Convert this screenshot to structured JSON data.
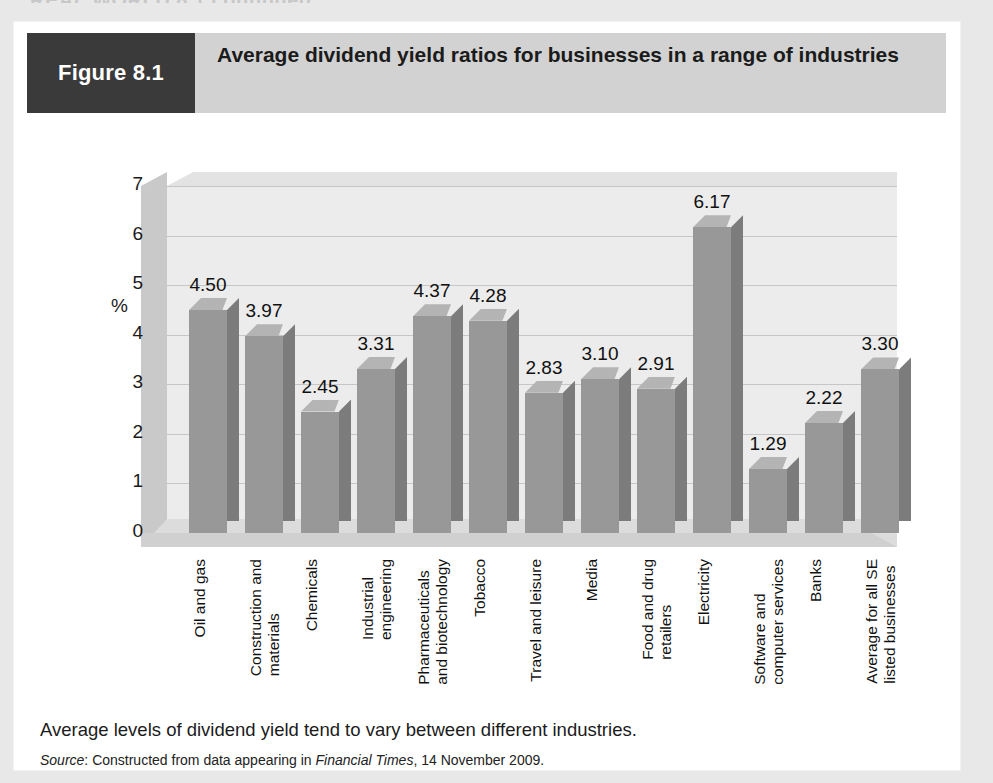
{
  "page": {
    "running_head": "REAL WORLD 8.1   continued"
  },
  "figure": {
    "tag": "Figure 8.1",
    "title": "Average dividend yield ratios for businesses in a range of industries",
    "caption": "Average levels of dividend yield tend to vary between different industries.",
    "source_prefix": "Source",
    "source_text_1": ": Constructed from data appearing in ",
    "source_publication": "Financial Times",
    "source_text_2": ", 14 November 2009."
  },
  "colors": {
    "tag_background": "#3a3a3a",
    "header_background": "#d2d2d2",
    "bar_front": "#989898",
    "bar_side": "#7c7c7c",
    "bar_top": "#b4b4b4",
    "plot_background": "#ececec",
    "gridline": "#c6c6c6",
    "page_background": "#e8e8e8",
    "card_background": "#ffffff"
  },
  "chart_data": {
    "type": "bar",
    "title": "Average dividend yield ratios for businesses in a range of industries",
    "xlabel": "",
    "ylabel": "%",
    "ylim": [
      0,
      7
    ],
    "yticks": [
      0,
      1,
      2,
      3,
      4,
      5,
      6,
      7
    ],
    "grid": true,
    "legend": "none",
    "categories": [
      "Oil and gas",
      "Construction and materials",
      "Chemicals",
      "Industrial engineering",
      "Pharmaceuticals and biotechnology",
      "Tobacco",
      "Travel and leisure",
      "Media",
      "Food and drug retailers",
      "Electricity",
      "Software and computer services",
      "Banks",
      "Average for all SE listed businesses"
    ],
    "category_lines": [
      [
        "Oil and gas"
      ],
      [
        "Construction and",
        "materials"
      ],
      [
        "Chemicals"
      ],
      [
        "Industrial",
        "engineering"
      ],
      [
        "Pharmaceuticals",
        "and biotechnology"
      ],
      [
        "Tobacco"
      ],
      [
        "Travel and leisure"
      ],
      [
        "Media"
      ],
      [
        "Food and drug",
        "retailers"
      ],
      [
        "Electricity"
      ],
      [
        "Software and",
        "computer services"
      ],
      [
        "Banks"
      ],
      [
        "Average for all SE",
        "listed businesses"
      ]
    ],
    "values": [
      4.5,
      3.97,
      2.45,
      3.31,
      4.37,
      4.28,
      2.83,
      3.1,
      2.91,
      6.17,
      1.29,
      2.22,
      3.3
    ],
    "value_labels": [
      "4.50",
      "3.97",
      "2.45",
      "3.31",
      "4.37",
      "4.28",
      "2.83",
      "3.10",
      "2.91",
      "6.17",
      "1.29",
      "2.22",
      "3.30"
    ]
  }
}
